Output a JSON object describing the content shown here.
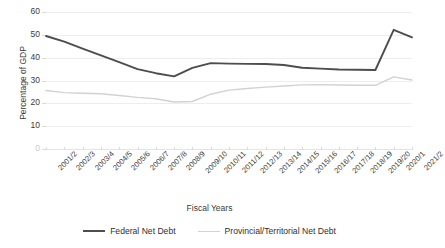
{
  "chart_data": {
    "type": "line",
    "title": "",
    "xlabel": "Fiscal Years",
    "ylabel": "Percentage of GDP",
    "ylim": [
      0,
      60
    ],
    "yticks": [
      0,
      10,
      20,
      30,
      40,
      50,
      60
    ],
    "grid": true,
    "legend_position": "bottom",
    "categories": [
      "2001/2",
      "2002/3",
      "2003/4",
      "2004/5",
      "2005/6",
      "2006/7",
      "2007/8",
      "2008/9",
      "2009/10",
      "2010/11",
      "2011/12",
      "2012/13",
      "2013/14",
      "2014/15",
      "2015/16",
      "2016/17",
      "2017/18",
      "2018/19",
      "2019/20",
      "2020/1",
      "2021/2"
    ],
    "series": [
      {
        "name": "Federal Net Debt",
        "color": "#4d4d4d",
        "values": [
          49.5,
          47.0,
          44.0,
          41.0,
          38.0,
          35.0,
          33.2,
          31.8,
          35.5,
          37.6,
          37.4,
          37.3,
          37.2,
          36.8,
          35.6,
          35.2,
          34.8,
          34.7,
          34.6,
          52.2,
          48.9
        ]
      },
      {
        "name": "Provincial/Territorial Net Debt",
        "color": "#d2d2d2",
        "values": [
          25.6,
          24.7,
          24.4,
          24.2,
          23.4,
          22.6,
          22.0,
          20.6,
          20.8,
          24.0,
          25.8,
          26.5,
          27.1,
          27.6,
          28.1,
          28.2,
          28.0,
          27.9,
          27.9,
          31.6,
          30.2
        ]
      }
    ]
  },
  "legend": {
    "items": [
      {
        "label": "Federal Net Debt"
      },
      {
        "label": "Provincial/Territorial Net Debt"
      }
    ]
  }
}
